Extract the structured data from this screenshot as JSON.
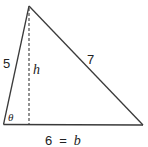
{
  "figure": {
    "type": "triangle-with-altitude",
    "sides": {
      "left": {
        "label": "5"
      },
      "right": {
        "label": "7"
      },
      "base": {
        "label": "6 = b",
        "value_label": "6",
        "symbol": "b"
      }
    },
    "altitude": {
      "label": "h",
      "style": "dashed"
    },
    "angle": {
      "label": "θ",
      "location": "bottom-left vertex"
    },
    "colors": {
      "stroke": "#3a3a3a",
      "text": "#222222",
      "background": "#ffffff"
    }
  }
}
